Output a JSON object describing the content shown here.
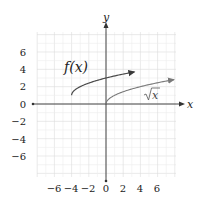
{
  "graph": {
    "x_axis_label": "x",
    "y_axis_label": "y",
    "x_ticks": [
      "−6",
      "−4",
      "−2",
      "0",
      "2",
      "4",
      "6"
    ],
    "y_ticks": [
      "6",
      "4",
      "2",
      "0",
      "−2",
      "−4",
      "−6"
    ],
    "curve_f_label": "f(x)",
    "curve_sqrt_label": "x",
    "colors": {
      "grid": "#e3e3e3",
      "axis": "#333333",
      "curve_f": "#4a4a4a",
      "curve_sqrt": "#7a7a7a"
    }
  },
  "chart_data": {
    "type": "line",
    "title": "",
    "xlabel": "x",
    "ylabel": "y",
    "xlim": [
      -8,
      8
    ],
    "ylim": [
      -8,
      8
    ],
    "grid": true,
    "x_ticks": [
      -6,
      -4,
      -2,
      0,
      2,
      4,
      6
    ],
    "y_ticks": [
      -6,
      -4,
      -2,
      0,
      2,
      4,
      6
    ],
    "series": [
      {
        "name": "f(x)",
        "expression": "sqrt(x+4)+1",
        "x": [
          -4,
          -3,
          -2,
          -1,
          0,
          1,
          2,
          3.3
        ],
        "y": [
          1,
          2,
          2.41,
          2.73,
          3,
          3.24,
          3.45,
          3.7
        ]
      },
      {
        "name": "√x",
        "expression": "sqrt(x)",
        "x": [
          0,
          1,
          2,
          4,
          6,
          8
        ],
        "y": [
          0,
          1,
          1.41,
          2,
          2.45,
          2.83
        ]
      }
    ],
    "annotations": [
      "f(x)",
      "√x"
    ]
  }
}
